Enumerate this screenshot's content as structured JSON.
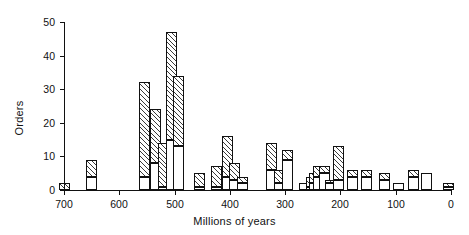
{
  "chart_data": {
    "type": "bar",
    "title": "",
    "subtitle": "",
    "xlabel": "Millions of years",
    "ylabel": "Orders",
    "xlim": [
      700,
      0
    ],
    "ylim": [
      0,
      50
    ],
    "xticks": [
      700,
      600,
      500,
      400,
      300,
      200,
      100,
      0
    ],
    "yticks": [
      0,
      10,
      20,
      30,
      40,
      50
    ],
    "grid": false,
    "legend_position": "none",
    "axis_direction": "x-reversed",
    "bin_width": 10,
    "stacked": true,
    "series": [
      {
        "name": "white-segment",
        "fill": "white"
      },
      {
        "name": "hatched-segment",
        "fill": "diagonal-hatch"
      }
    ],
    "bars": [
      {
        "x": 700,
        "white": 0,
        "hatch": 2,
        "total": 2
      },
      {
        "x": 650,
        "white": 4,
        "hatch": 5,
        "total": 9
      },
      {
        "x": 555,
        "white": 4,
        "hatch": 28,
        "total": 32
      },
      {
        "x": 535,
        "white": 8,
        "hatch": 16,
        "total": 24
      },
      {
        "x": 520,
        "white": 1,
        "hatch": 13,
        "total": 14
      },
      {
        "x": 505,
        "white": 15,
        "hatch": 32,
        "total": 47
      },
      {
        "x": 493,
        "white": 13,
        "hatch": 21,
        "total": 34
      },
      {
        "x": 455,
        "white": 1,
        "hatch": 4,
        "total": 5
      },
      {
        "x": 425,
        "white": 1,
        "hatch": 6,
        "total": 7
      },
      {
        "x": 405,
        "white": 4,
        "hatch": 12,
        "total": 16
      },
      {
        "x": 392,
        "white": 3,
        "hatch": 5,
        "total": 8
      },
      {
        "x": 378,
        "white": 2,
        "hatch": 2,
        "total": 4
      },
      {
        "x": 325,
        "white": 6,
        "hatch": 8,
        "total": 14
      },
      {
        "x": 310,
        "white": 2,
        "hatch": 4,
        "total": 6
      },
      {
        "x": 295,
        "white": 9,
        "hatch": 3,
        "total": 12
      },
      {
        "x": 265,
        "white": 2,
        "hatch": 0,
        "total": 2
      },
      {
        "x": 253,
        "white": 1,
        "hatch": 3,
        "total": 4
      },
      {
        "x": 246,
        "white": 2,
        "hatch": 3,
        "total": 5
      },
      {
        "x": 239,
        "white": 4,
        "hatch": 3,
        "total": 7
      },
      {
        "x": 228,
        "white": 5,
        "hatch": 2,
        "total": 7
      },
      {
        "x": 218,
        "white": 2,
        "hatch": 1,
        "total": 3
      },
      {
        "x": 203,
        "white": 3,
        "hatch": 10,
        "total": 13
      },
      {
        "x": 178,
        "white": 4,
        "hatch": 2,
        "total": 6
      },
      {
        "x": 152,
        "white": 4,
        "hatch": 2,
        "total": 6
      },
      {
        "x": 120,
        "white": 3,
        "hatch": 2,
        "total": 5
      },
      {
        "x": 95,
        "white": 2,
        "hatch": 0,
        "total": 2
      },
      {
        "x": 68,
        "white": 4,
        "hatch": 2,
        "total": 6
      },
      {
        "x": 45,
        "white": 5,
        "hatch": 0,
        "total": 5
      },
      {
        "x": 5,
        "white": 1,
        "hatch": 1,
        "total": 2
      }
    ]
  },
  "axes": {
    "ylabel_text": "Orders",
    "xlabel_text": "Millions of years"
  }
}
